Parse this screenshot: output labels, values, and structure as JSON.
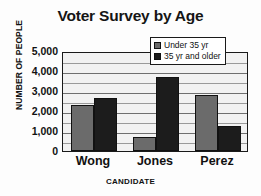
{
  "chart_data": {
    "type": "bar",
    "title": "Voter Survey by Age",
    "xlabel": "CANDIDATE",
    "ylabel": "NUMBER OF PEOPLE",
    "categories": [
      "Wong",
      "Jones",
      "Perez"
    ],
    "series": [
      {
        "name": "Under 35 yr",
        "color": "#6b6b6b",
        "values": [
          2300,
          700,
          2800
        ]
      },
      {
        "name": "35 yr and older",
        "color": "#1c1c1c",
        "values": [
          2650,
          3700,
          1250
        ]
      }
    ],
    "ylim": [
      0,
      5000
    ],
    "ytick_values": [
      0,
      1000,
      2000,
      3000,
      4000,
      5000
    ],
    "ytick_labels": [
      "0",
      "1,000",
      "2,000",
      "3,000",
      "4,000",
      "5,000"
    ],
    "minor_tick_step": 500,
    "grid": true,
    "legend_position": "top-right",
    "plot_background": "#f2f2f2",
    "axis_color": "#1a1a1a"
  }
}
